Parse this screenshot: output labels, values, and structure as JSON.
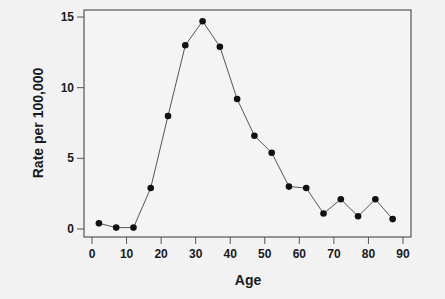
{
  "chart_data": {
    "type": "line",
    "title": "",
    "xlabel": "Age",
    "ylabel": "Rate per 100,000",
    "xlim": [
      0,
      90
    ],
    "ylim": [
      0,
      15
    ],
    "x_ticks": [
      0,
      10,
      20,
      30,
      40,
      50,
      60,
      70,
      80,
      90
    ],
    "y_ticks": [
      0,
      5,
      10,
      15
    ],
    "grid": false,
    "legend": null,
    "markers": true,
    "series": [
      {
        "name": "Rate per 100,000",
        "x": [
          2,
          7,
          12,
          17,
          22,
          27,
          32,
          37,
          42,
          47,
          52,
          57,
          62,
          67,
          72,
          77,
          82,
          87
        ],
        "values": [
          0.4,
          0.1,
          0.1,
          2.9,
          8.0,
          13.0,
          14.7,
          12.9,
          9.2,
          6.6,
          5.4,
          3.0,
          2.9,
          1.1,
          2.1,
          0.9,
          2.1,
          0.7
        ]
      }
    ]
  },
  "colors": {
    "background": "#f2f2f2",
    "plot_background": "#f4f4f4",
    "axis": "#555555",
    "line": "#555555",
    "marker": "#111111"
  }
}
